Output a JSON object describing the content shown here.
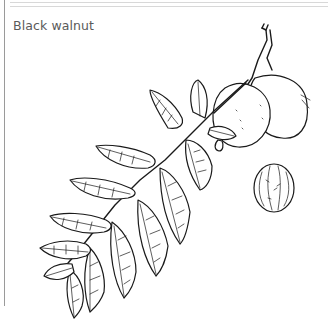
{
  "figure": {
    "caption": "Black walnut",
    "illustration": "black-walnut-branch-illustration",
    "elements": [
      "compound-leaf",
      "walnut-fruits",
      "walnut-nut"
    ]
  },
  "colors": {
    "background": "#ffffff",
    "caption_text": "#5a5a5a",
    "line_art": "#1a1a1a",
    "border": "#9a9a9a"
  }
}
